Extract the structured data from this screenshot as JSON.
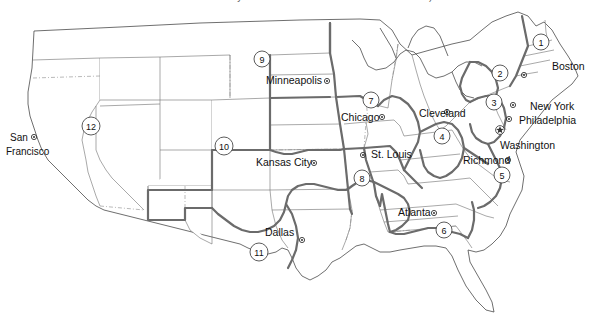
{
  "caption": {
    "text": "the states served by the Federal Reserve Bank of San Francisco)"
  },
  "map": {
    "title": "Federal Reserve Districts of the United States",
    "colors": {
      "state_border": "#6f6f6f",
      "district_border": "#6b6b6b",
      "coastline": "#4a4a4a",
      "land_fill": "#ffffff",
      "text": "#111111"
    },
    "districts": [
      {
        "number": "1",
        "city": "Boston",
        "num_x": 541,
        "num_y": 42,
        "label_x": 552,
        "label_y": 70,
        "dot_x": 524,
        "dot_y": 75,
        "anchor": "start"
      },
      {
        "number": "2",
        "city": "New York",
        "num_x": 500,
        "num_y": 73,
        "label_x": 530,
        "label_y": 110,
        "dot_x": 513,
        "dot_y": 105,
        "anchor": "start"
      },
      {
        "number": "3",
        "city": "Philadelphia",
        "num_x": 494,
        "num_y": 102,
        "label_x": 519,
        "label_y": 124,
        "dot_x": 509,
        "dot_y": 119,
        "anchor": "start"
      },
      {
        "number": "4",
        "city": "Cleveland",
        "num_x": 442,
        "num_y": 136,
        "label_x": 419,
        "label_y": 117,
        "dot_x": 447,
        "dot_y": 112,
        "anchor": "start"
      },
      {
        "number": "5",
        "city": "Richmond",
        "num_x": 502,
        "num_y": 175,
        "label_x": 463,
        "label_y": 164,
        "dot_x": 508,
        "dot_y": 160,
        "anchor": "start"
      },
      {
        "number": "6",
        "city": "Atlanta",
        "num_x": 444,
        "num_y": 230,
        "label_x": 398,
        "label_y": 216,
        "dot_x": 434,
        "dot_y": 213,
        "anchor": "start"
      },
      {
        "number": "7",
        "city": "Chicago",
        "num_x": 371,
        "num_y": 100,
        "label_x": 341,
        "label_y": 121,
        "dot_x": 382,
        "dot_y": 117,
        "anchor": "start"
      },
      {
        "number": "8",
        "city": "St. Louis",
        "num_x": 362,
        "num_y": 178,
        "label_x": 371,
        "label_y": 158,
        "dot_x": 363,
        "dot_y": 155,
        "anchor": "start"
      },
      {
        "number": "9",
        "city": "Minneapolis",
        "num_x": 262,
        "num_y": 59,
        "label_x": 266,
        "label_y": 84,
        "dot_x": 327,
        "dot_y": 81,
        "anchor": "start"
      },
      {
        "number": "10",
        "city": "Kansas City",
        "num_x": 224,
        "num_y": 146,
        "label_x": 256,
        "label_y": 166,
        "dot_x": 314,
        "dot_y": 163,
        "anchor": "start"
      },
      {
        "number": "11",
        "city": "Dallas",
        "num_x": 259,
        "num_y": 252,
        "label_x": 265,
        "label_y": 236,
        "dot_x": 302,
        "dot_y": 240,
        "anchor": "start"
      },
      {
        "number": "12",
        "city": "San Francisco",
        "num_x": 91,
        "num_y": 126,
        "label_x": 10,
        "label_y": 141,
        "dot_x": 34,
        "dot_y": 137,
        "anchor": "start"
      }
    ],
    "san_francisco_lines": [
      "San",
      "Francisco"
    ],
    "washington": {
      "label": "Washington",
      "label_x": 500,
      "label_y": 147,
      "star_x": 500,
      "star_y": 130,
      "marker": "star-icon"
    }
  }
}
